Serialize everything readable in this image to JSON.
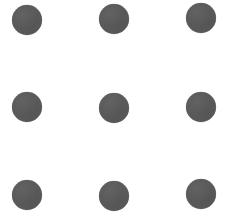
{
  "canvas": {
    "width": 228,
    "height": 221,
    "background_color": "#ffffff"
  },
  "graphic": {
    "name": "three-by-three-dot-grid",
    "shape": "circle",
    "dot_color": "#5a5a5a",
    "dot_diameter": 30,
    "rows": 3,
    "columns": 3,
    "count": 9,
    "column_centers_x": [
      27,
      114,
      201
    ],
    "row_centers_y": [
      20,
      107,
      195
    ],
    "dots": [
      {
        "id": "dot-r1-c1",
        "row": 1,
        "column": 1,
        "cx": 27,
        "cy": 20,
        "d": 30
      },
      {
        "id": "dot-r1-c2",
        "row": 1,
        "column": 2,
        "cx": 114,
        "cy": 19,
        "d": 30
      },
      {
        "id": "dot-r1-c3",
        "row": 1,
        "column": 3,
        "cx": 201,
        "cy": 18,
        "d": 30
      },
      {
        "id": "dot-r2-c1",
        "row": 2,
        "column": 1,
        "cx": 27,
        "cy": 107,
        "d": 30
      },
      {
        "id": "dot-r2-c2",
        "row": 2,
        "column": 2,
        "cx": 114,
        "cy": 108,
        "d": 30
      },
      {
        "id": "dot-r2-c3",
        "row": 2,
        "column": 3,
        "cx": 201,
        "cy": 107,
        "d": 30
      },
      {
        "id": "dot-r3-c1",
        "row": 3,
        "column": 1,
        "cx": 27,
        "cy": 195,
        "d": 30
      },
      {
        "id": "dot-r3-c2",
        "row": 3,
        "column": 2,
        "cx": 114,
        "cy": 196,
        "d": 30
      },
      {
        "id": "dot-r3-c3",
        "row": 3,
        "column": 3,
        "cx": 201,
        "cy": 194,
        "d": 30
      }
    ]
  }
}
